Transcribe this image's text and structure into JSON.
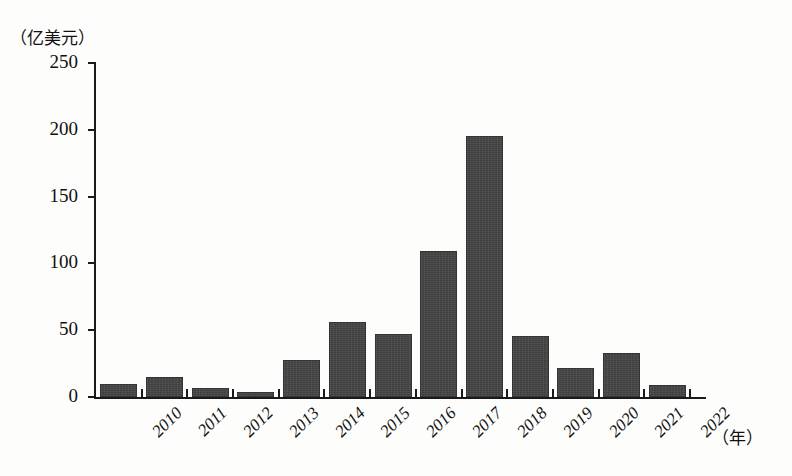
{
  "chart_data": {
    "type": "bar",
    "title": "",
    "subtitle": "",
    "xlabel": "（年）",
    "ylabel": "（亿美元）",
    "categories": [
      "2010",
      "2011",
      "2012",
      "2013",
      "2014",
      "2015",
      "2016",
      "2017",
      "2018",
      "2019",
      "2020",
      "2021",
      "2022"
    ],
    "values": [
      10,
      15,
      7,
      4,
      28,
      56,
      47,
      109,
      195,
      46,
      22,
      33,
      9
    ],
    "series": [
      {
        "name": "",
        "values": [
          10,
          15,
          7,
          4,
          28,
          56,
          47,
          109,
          195,
          46,
          22,
          33,
          9
        ]
      }
    ],
    "ylim": [
      0,
      250
    ],
    "y_ticks": [
      0,
      50,
      100,
      150,
      200,
      250
    ],
    "y_tick_labels": [
      "0",
      "50",
      "100",
      "150",
      "200",
      "250"
    ],
    "grid": false,
    "legend": "none",
    "bar_color": "#3f3f3f",
    "background_color": "#fdfdfc",
    "axis_color": "#1a1a1a"
  },
  "axes": {
    "y_unit_caption": "（亿美元）",
    "x_unit_caption": "（年）"
  }
}
